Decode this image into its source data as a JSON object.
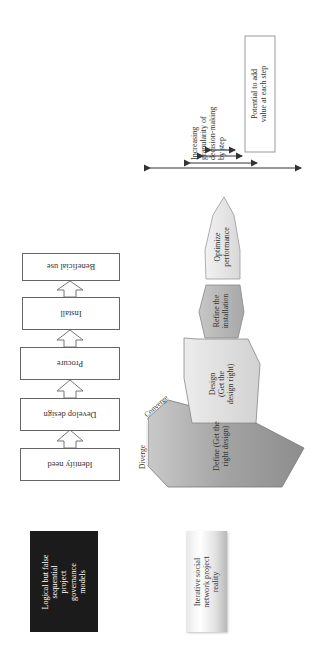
{
  "figure": {
    "orientation": "rotated 90 degrees counter-clockwise",
    "left_labels": {
      "sequential": "Logical but false\nsequential\nproject\ngovernance\nmodels",
      "iterative": "Iterative social\nnetwork project\nreality"
    },
    "sequential_steps": [
      {
        "label": "Identify need"
      },
      {
        "label": "Develop design"
      },
      {
        "label": "Procure"
      },
      {
        "label": "Install"
      },
      {
        "label": "Beneficial use"
      }
    ],
    "iterative_stages": [
      {
        "label": "Define (Get the\nright design)",
        "color": "#9e9e9e"
      },
      {
        "label": "Design\n(Get the\ndesign right)",
        "color": "#dcdcdc"
      },
      {
        "label": "Refine the\ninstallation",
        "color": "#b4b4b4"
      },
      {
        "label": "Optimize\nperformance",
        "color": "#e6e6e6"
      }
    ],
    "diverge_label": "Diverge",
    "converge_label": "Converge",
    "legend": {
      "granularity": "Increasing\ngranularity of\ndecision-making\nby step",
      "potential": "Potential to add\nvalue at each step"
    }
  }
}
